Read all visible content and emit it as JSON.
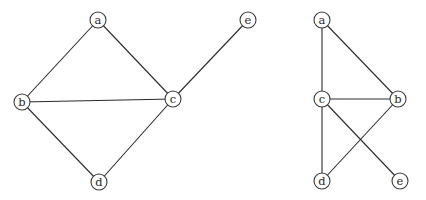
{
  "diagram": {
    "style": {
      "background": "#ffffff",
      "edge_color": "#2b2b2b",
      "node_stroke": "#3a3a3a",
      "node_fill": "#ffffff",
      "label_color": "#2a2a2a",
      "node_radius": 8
    },
    "graphs": [
      {
        "id": "left",
        "nodes": [
          {
            "id": "a",
            "label": "a",
            "x": 98,
            "y": 20
          },
          {
            "id": "b",
            "label": "b",
            "x": 22,
            "y": 102
          },
          {
            "id": "c",
            "label": "c",
            "x": 173,
            "y": 99
          },
          {
            "id": "d",
            "label": "d",
            "x": 99,
            "y": 182
          },
          {
            "id": "e",
            "label": "e",
            "x": 248,
            "y": 20
          }
        ],
        "edges": [
          [
            "a",
            "b"
          ],
          [
            "a",
            "c"
          ],
          [
            "b",
            "c"
          ],
          [
            "b",
            "d"
          ],
          [
            "c",
            "d"
          ],
          [
            "c",
            "e"
          ]
        ]
      },
      {
        "id": "right",
        "nodes": [
          {
            "id": "a",
            "label": "a",
            "x": 322,
            "y": 20
          },
          {
            "id": "c",
            "label": "c",
            "x": 322,
            "y": 99
          },
          {
            "id": "b",
            "label": "b",
            "x": 398,
            "y": 99
          },
          {
            "id": "d",
            "label": "d",
            "x": 322,
            "y": 181
          },
          {
            "id": "e",
            "label": "e",
            "x": 400,
            "y": 181
          }
        ],
        "edges": [
          [
            "a",
            "c"
          ],
          [
            "a",
            "b"
          ],
          [
            "c",
            "b"
          ],
          [
            "c",
            "d"
          ],
          [
            "c",
            "e"
          ],
          [
            "b",
            "d"
          ]
        ]
      }
    ]
  }
}
